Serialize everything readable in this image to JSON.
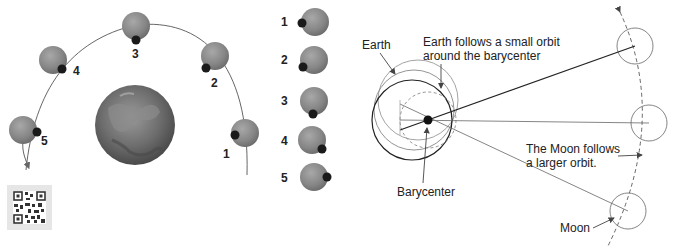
{
  "left_diagram": {
    "orbit_positions": [
      {
        "label": "1"
      },
      {
        "label": "2"
      },
      {
        "label": "3"
      },
      {
        "label": "4"
      },
      {
        "label": "5"
      }
    ],
    "face_sequence": [
      {
        "label": "1"
      },
      {
        "label": "2"
      },
      {
        "label": "3"
      },
      {
        "label": "4"
      },
      {
        "label": "5"
      }
    ],
    "colors": {
      "moon": "#8a8a8a",
      "moon_marker": "#1a1a1a",
      "earth": "#6a6a6a",
      "orbit_line": "#555555"
    }
  },
  "right_diagram": {
    "labels": {
      "earth": "Earth",
      "earth_orbit_line1": "Earth follows a small orbit",
      "earth_orbit_line2": "around the barycenter",
      "barycenter": "Barycenter",
      "moon_orbit_line1": "The Moon follows",
      "moon_orbit_line2": "a larger orbit.",
      "moon": "Moon"
    },
    "colors": {
      "line": "#444444",
      "circle": "#777777",
      "barycenter": "#111111"
    }
  }
}
